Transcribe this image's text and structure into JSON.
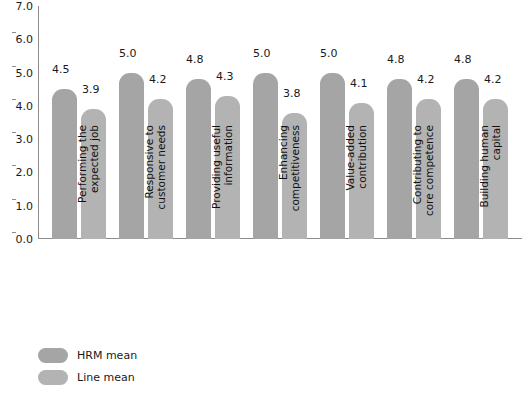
{
  "chart_data": {
    "type": "bar",
    "title": "",
    "xlabel": "",
    "ylabel": "",
    "ylim": [
      0.0,
      7.0
    ],
    "grid": false,
    "legend_position": "bottom-left",
    "y_ticks": [
      "0.0",
      "1.0",
      "2.0",
      "3.0",
      "4.0",
      "5.0",
      "6.0",
      "7.0"
    ],
    "categories": [
      "Performing the\nexpected job",
      "Responsive to\ncustomer needs",
      "Providing useful\ninformation",
      "Enhancing\ncompetitiveness",
      "Value-added\ncontribution",
      "Contributing to\ncore competence",
      "Building human\ncapital"
    ],
    "series": [
      {
        "name": "HRM mean",
        "color": "#a5a5a5",
        "values": [
          4.5,
          5.0,
          4.8,
          5.0,
          5.0,
          4.8,
          4.8
        ],
        "labels": [
          "4.5",
          "5.0",
          "4.8",
          "5.0",
          "5.0",
          "4.8",
          "4.8"
        ]
      },
      {
        "name": "Line mean",
        "color": "#b3b3b3",
        "values": [
          3.9,
          4.2,
          4.3,
          3.8,
          4.1,
          4.2,
          4.2
        ],
        "labels": [
          "3.9",
          "4.2",
          "4.3",
          "3.8",
          "4.1",
          "4.2",
          "4.2"
        ]
      }
    ]
  },
  "legend": {
    "items": [
      {
        "label": "HRM mean",
        "color": "#a5a5a5"
      },
      {
        "label": "Line mean",
        "color": "#b3b3b3"
      }
    ]
  }
}
